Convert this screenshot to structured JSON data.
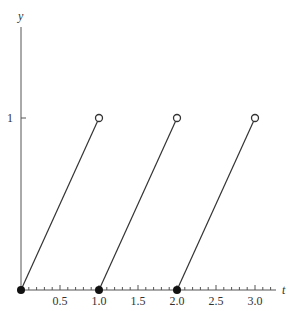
{
  "chart_data": {
    "type": "line",
    "title": "",
    "xlabel": "t",
    "ylabel": "y",
    "xlim": [
      0,
      3.25
    ],
    "ylim": [
      0,
      1.5
    ],
    "x_ticks": [
      0.5,
      1.0,
      1.5,
      2.0,
      2.5,
      3.0
    ],
    "x_tick_labels": [
      "0.5",
      "1.0",
      "1.5",
      "2.0",
      "2.5",
      "3.0"
    ],
    "x_minor_tick_step": 0.1,
    "y_ticks": [
      1
    ],
    "y_tick_labels": [
      "1"
    ],
    "grid": false,
    "legend": null,
    "series": [
      {
        "name": "segment-1",
        "x": [
          0,
          1
        ],
        "y": [
          0,
          1
        ],
        "start_marker": "filled",
        "end_marker": "open"
      },
      {
        "name": "segment-2",
        "x": [
          1,
          2
        ],
        "y": [
          0,
          1
        ],
        "start_marker": "filled",
        "end_marker": "open"
      },
      {
        "name": "segment-3",
        "x": [
          2,
          3
        ],
        "y": [
          0,
          1
        ],
        "start_marker": "filled",
        "end_marker": "open"
      }
    ],
    "colors": {
      "line": "#333333",
      "axis": "#555555"
    }
  }
}
